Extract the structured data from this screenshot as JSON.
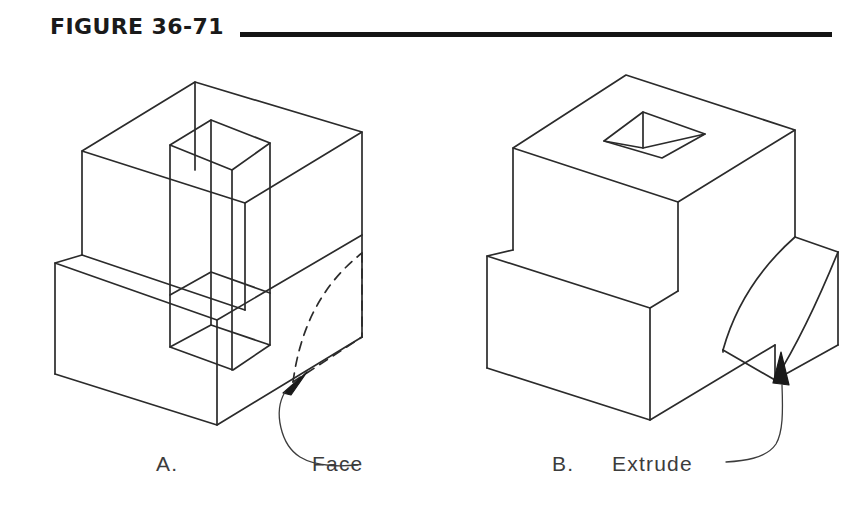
{
  "figure": {
    "title": "FIGURE 36-71",
    "rule_color": "#141414",
    "background_color": "#ffffff",
    "line_color": "#2b2b2b",
    "text_color": "#3c3c3c"
  },
  "captions": {
    "a_label": "A.",
    "a_callout": "Face",
    "b_label": "B.",
    "b_callout": "Extrude"
  },
  "panels": [
    {
      "id": "a",
      "label": "A.",
      "callout": "Face",
      "style": "wireframe-isometric",
      "description": "Wireframe isometric block with rectangular through-hole prism, stepped notch at front-left, and dashed arc face on the right side indicating the face to be selected"
    },
    {
      "id": "b",
      "label": "B.",
      "callout": "Extrude",
      "style": "solid-isometric",
      "description": "Solid isometric block with square pocket on top face, stepped notch at front-left, and curved filleted extruded boss on the right side"
    }
  ],
  "annotations": [
    {
      "name": "face-arrow",
      "target_panel": "a",
      "points_to": "dashed-arc-face"
    },
    {
      "name": "extrude-arrow",
      "target_panel": "b",
      "points_to": "curved-boss"
    }
  ]
}
